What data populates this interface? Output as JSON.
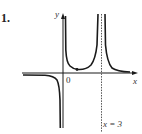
{
  "problem": {
    "number": "1."
  },
  "graph": {
    "axis_labels": {
      "x": "x",
      "y": "y"
    },
    "origin_label": "0",
    "asymptote_label": "x = 3",
    "asymptote_x": 3,
    "colors": {
      "curve": "#1a1a1a",
      "axis": "#1a1a1a",
      "asymptote": "#555555"
    }
  }
}
